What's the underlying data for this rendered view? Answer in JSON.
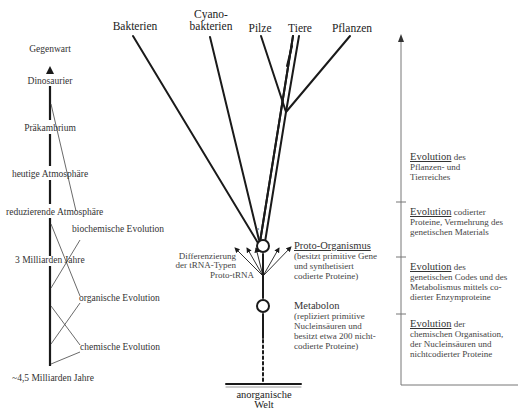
{
  "timeline": {
    "labels": [
      {
        "text": "Gegenwart"
      },
      {
        "text": "Dinosaurier"
      },
      {
        "text": "Präkambrium"
      },
      {
        "text": "heutige Atmosphäre"
      },
      {
        "text": "reduzierende Atmosphäre"
      },
      {
        "text": "3 Milliarden Jahre"
      },
      {
        "text": "~4,5 Milliarden Jahre"
      }
    ],
    "phases": [
      {
        "text": "biochemische Evolution"
      },
      {
        "text": "organische Evolution"
      },
      {
        "text": "chemische Evolution"
      }
    ]
  },
  "tree": {
    "tips": [
      {
        "line1": "Bakterien"
      },
      {
        "line1": "Cyano-",
        "line2": "bakterien"
      },
      {
        "line1": "Pilze"
      },
      {
        "line1": "Tiere"
      },
      {
        "line1": "Pflanzen"
      }
    ],
    "question_mark": "?",
    "trna": {
      "diff_line1": "Differenzierung",
      "diff_line2": "der tRNA-Typen",
      "proto": "Proto-tRNA"
    },
    "proto_organismus": {
      "title": "Proto-Organismus",
      "lines": [
        "(besitzt primitive Gene",
        "und synthetisiert",
        "codierte Proteine)"
      ]
    },
    "metabolon": {
      "title": "Metabolon",
      "lines": [
        "(repliziert primitive",
        "Nucleinsäuren und",
        "besitzt etwa 200 nicht-",
        "codierte Proteine)"
      ]
    },
    "base": {
      "line1": "anorganische",
      "line2": "Welt"
    }
  },
  "stages": [
    {
      "head": "Evolution",
      "rest": " des",
      "lines": [
        "Pflanzen- und",
        "Tierreiches"
      ]
    },
    {
      "head": "Evolution",
      "rest": " codierter",
      "lines": [
        "Proteine, Vermehrung des",
        "genetischen Materials"
      ]
    },
    {
      "head": "Evolution",
      "rest": " des",
      "lines": [
        "genetischen Codes und des",
        "Metabolismus mittels co-",
        "dierter Enzymproteine"
      ]
    },
    {
      "head": "Evolution",
      "rest": " der",
      "lines": [
        "chemischen Organisation,",
        "der Nucleinsäuren und",
        "nichtcodierter Proteine"
      ]
    }
  ],
  "colors": {
    "ink": "#1a1a1a",
    "thin": "#555555",
    "axis": "#888888"
  }
}
